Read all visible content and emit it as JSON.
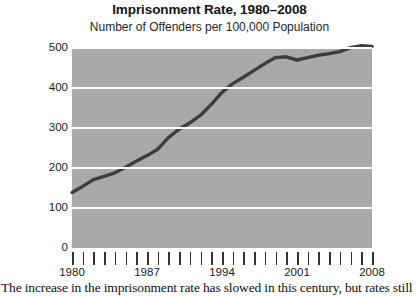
{
  "chart_data": {
    "type": "line",
    "title": "Imprisonment Rate, 1980–2008",
    "subtitle": "Number of Offenders per 100,000 Population",
    "xlabel": "",
    "ylabel": "",
    "ylim": [
      0,
      500
    ],
    "xlim": [
      1980,
      2008
    ],
    "yticks": [
      0,
      100,
      200,
      300,
      400,
      500
    ],
    "ytick_labels": [
      "0",
      "100",
      "200",
      "300",
      "400",
      "500"
    ],
    "xtick_labels": [
      "1980",
      "1987",
      "1994",
      "2001",
      "2008"
    ],
    "xtick_label_years": [
      1980,
      1987,
      1994,
      2001,
      2008
    ],
    "grid": "horizontal-white-gridlines",
    "legend": "none",
    "plot_background_color": "#a9a9a9",
    "line_color": "#3d3d3d",
    "x": [
      1980,
      1981,
      1982,
      1983,
      1984,
      1985,
      1986,
      1987,
      1988,
      1989,
      1990,
      1991,
      1992,
      1993,
      1994,
      1995,
      1996,
      1997,
      1998,
      1999,
      2000,
      2001,
      2002,
      2003,
      2004,
      2005,
      2006,
      2007,
      2008
    ],
    "values": [
      139,
      154,
      171,
      179,
      188,
      202,
      217,
      231,
      247,
      276,
      297,
      313,
      332,
      359,
      389,
      411,
      427,
      444,
      461,
      476,
      478,
      470,
      476,
      482,
      486,
      491,
      501,
      506,
      504
    ],
    "series": [
      {
        "name": "Imprisonment rate per 100,000 population",
        "values": [
          139,
          154,
          171,
          179,
          188,
          202,
          217,
          231,
          247,
          276,
          297,
          313,
          332,
          359,
          389,
          411,
          427,
          444,
          461,
          476,
          478,
          470,
          476,
          482,
          486,
          491,
          501,
          506,
          504
        ]
      }
    ]
  },
  "caption": {
    "text": "The increase in the imprisonment rate has slowed in this century, but rates still"
  }
}
